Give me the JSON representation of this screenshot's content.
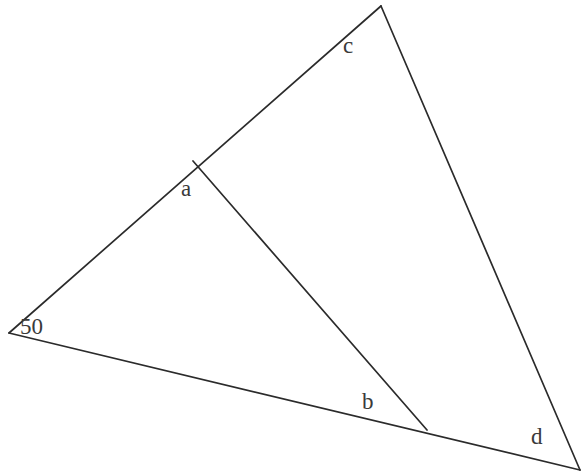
{
  "diagram": {
    "type": "triangle-angle-problem",
    "points": {
      "left": {
        "x": 9,
        "y": 333
      },
      "top": {
        "x": 381,
        "y": 6
      },
      "right": {
        "x": 580,
        "y": 470
      },
      "a_junction": {
        "x": 193,
        "y": 161
      },
      "b_junction": {
        "x": 427,
        "y": 430
      }
    },
    "edges": [
      {
        "name": "left-to-top",
        "from": "left",
        "to": "top"
      },
      {
        "name": "top-to-right",
        "from": "top",
        "to": "right"
      },
      {
        "name": "left-to-right",
        "from": "left",
        "to": "right"
      },
      {
        "name": "inner-segment",
        "from": "a_junction",
        "to": "b_junction"
      }
    ],
    "labels": {
      "c": "c",
      "a": "a",
      "angle_50": "50",
      "b": "b",
      "d": "d"
    },
    "stroke_color": "#2b2b2b",
    "label_color": "#3a3a3a"
  }
}
